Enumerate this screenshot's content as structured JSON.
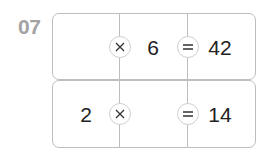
{
  "problem": {
    "number_label": "07",
    "rows": [
      {
        "a": "",
        "op": "×",
        "b": "6",
        "eq": "=",
        "result": "42"
      },
      {
        "a": "2",
        "op": "×",
        "b": "",
        "eq": "=",
        "result": "14"
      }
    ]
  },
  "colors": {
    "line": "#bdbdbd",
    "label": "#a3a3a3",
    "text": "#222222"
  }
}
